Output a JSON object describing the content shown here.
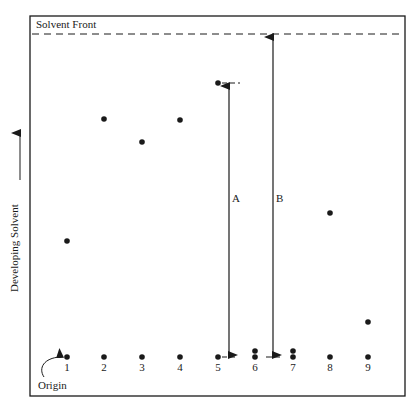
{
  "figure": {
    "solvent_front_label": "Solvent Front",
    "axis_label": "Developing Solvent",
    "origin_label": "Origin",
    "distance_labels": {
      "a": "A",
      "b": "B"
    },
    "colors": {
      "ink": "#1a1a1a",
      "background": "#ffffff"
    }
  },
  "lanes": [
    {
      "number": "1",
      "x": 67,
      "spots_y": [
        241
      ]
    },
    {
      "number": "2",
      "x": 104,
      "spots_y": [
        119
      ]
    },
    {
      "number": "3",
      "x": 142,
      "spots_y": [
        142
      ]
    },
    {
      "number": "4",
      "x": 180,
      "spots_y": [
        120
      ]
    },
    {
      "number": "5",
      "x": 218,
      "spots_y": [
        83
      ]
    },
    {
      "number": "6",
      "x": 255,
      "spots_y": [
        351,
        357
      ]
    },
    {
      "number": "7",
      "x": 293,
      "spots_y": [
        351,
        357
      ]
    },
    {
      "number": "8",
      "x": 330,
      "spots_y": [
        213
      ]
    },
    {
      "number": "9",
      "x": 368,
      "spots_y": [
        322
      ]
    }
  ],
  "geometry": {
    "box": {
      "left": 30,
      "top": 16,
      "right": 405,
      "bottom": 396
    },
    "solvent_front_y": 34,
    "origin_y": 357,
    "arrow_a_x": 229,
    "arrow_b_x": 273
  }
}
